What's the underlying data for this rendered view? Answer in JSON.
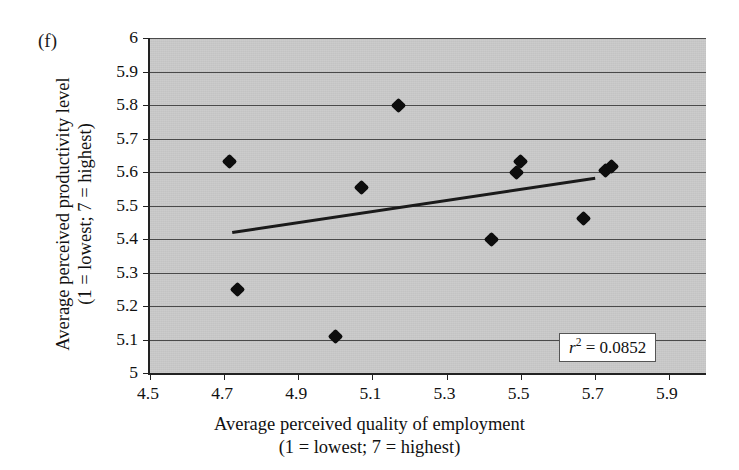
{
  "panel_label": "(f)",
  "axes": {
    "y_title_line1": "Average perceived productivity level",
    "y_title_line2": "(1 = lowest; 7 = highest)",
    "x_title_line1": "Average perceived quality of employment",
    "x_title_line2": "(1 = lowest; 7 = highest)",
    "y_ticks": [
      "5",
      "5.1",
      "5.2",
      "5.3",
      "5.4",
      "5.5",
      "5.6",
      "5.7",
      "5.8",
      "5.9",
      "6"
    ],
    "x_ticks": [
      "4.5",
      "4.7",
      "4.9",
      "5.1",
      "5.3",
      "5.5",
      "5.7",
      "5.9"
    ]
  },
  "annotation": {
    "r2_symbol": "r",
    "r2_exponent": "2",
    "r2_equals": " = ",
    "r2_value": "0.0852",
    "r2_full": "r2 = 0.0852"
  },
  "colors": {
    "plot_background": "#c9c9c9",
    "gridline": "#4a4a4a",
    "marker": "#0d0d0d",
    "trendline": "#1a1a1a",
    "axis": "#222222",
    "annotation_background": "#ffffff"
  },
  "chart_data": {
    "type": "scatter",
    "title": "",
    "xlabel": "Average perceived quality of employment (1 = lowest; 7 = highest)",
    "ylabel": "Average perceived productivity level (1 = lowest; 7 = highest)",
    "xlim": [
      4.5,
      6.0
    ],
    "ylim": [
      5.0,
      6.0
    ],
    "xticks": [
      4.5,
      4.7,
      4.9,
      5.1,
      5.3,
      5.5,
      5.7,
      5.9
    ],
    "yticks": [
      5.0,
      5.1,
      5.2,
      5.3,
      5.4,
      5.5,
      5.6,
      5.7,
      5.8,
      5.9,
      6.0
    ],
    "grid": "horizontal",
    "legend": "none",
    "r_squared": 0.0852,
    "points": [
      {
        "x": 4.715,
        "y": 5.63
      },
      {
        "x": 4.735,
        "y": 5.25
      },
      {
        "x": 5.0,
        "y": 5.11
      },
      {
        "x": 5.07,
        "y": 5.555
      },
      {
        "x": 5.17,
        "y": 5.8
      },
      {
        "x": 5.42,
        "y": 5.4
      },
      {
        "x": 5.49,
        "y": 5.6
      },
      {
        "x": 5.5,
        "y": 5.63
      },
      {
        "x": 5.67,
        "y": 5.46
      },
      {
        "x": 5.73,
        "y": 5.605
      },
      {
        "x": 5.745,
        "y": 5.615
      }
    ],
    "trendline": {
      "x0": 4.72,
      "y0": 5.423,
      "x1": 5.7,
      "y1": 5.585
    }
  }
}
